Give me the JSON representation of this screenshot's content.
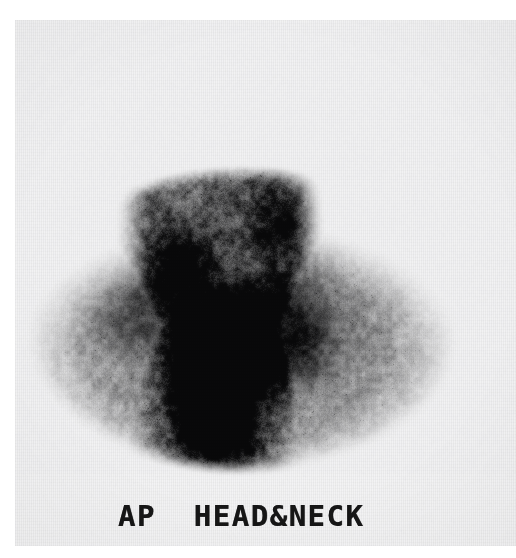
{
  "viewer": {
    "width": 516,
    "height": 558,
    "background_color": "#ffffff"
  },
  "film": {
    "name": "radiographic-film-sheet",
    "background_color": "#f4f4f5",
    "left": 15,
    "top": 20,
    "width": 501,
    "height": 526
  },
  "annotation": {
    "label": "AP  HEAD&NECK",
    "projection": "AP",
    "body_region": "HEAD&NECK",
    "text_color": "#161616"
  },
  "scintigram": {
    "modality": "planar-scintigraphy",
    "colormap": "grayscale-inverted",
    "background_level": "#f2f2f3",
    "max_uptake_color": "#121212",
    "anatomy_outline": "head-and-shoulders silhouette, anterior projection",
    "hot_spots": [
      {
        "name": "right-submandibular-focus",
        "cx": 205,
        "cy": 330,
        "intensity": 1.0
      },
      {
        "name": "left-submandibular-focus",
        "cx": 277,
        "cy": 312,
        "intensity": 0.96
      },
      {
        "name": "central-neck-column",
        "cx": 200,
        "cy": 390,
        "intensity": 0.8
      },
      {
        "name": "left-lateral-focus",
        "cx": 116,
        "cy": 292,
        "intensity": 0.55
      },
      {
        "name": "upper-left-parotid-region",
        "cx": 162,
        "cy": 245,
        "intensity": 0.5
      },
      {
        "name": "upper-right-orbital-focus",
        "cx": 268,
        "cy": 203,
        "intensity": 0.52
      }
    ]
  },
  "chart_data": {
    "type": "heatmap",
    "title": "AP  HEAD&NECK",
    "xlabel": "",
    "ylabel": "",
    "colormap": "gray_r",
    "regions": [
      {
        "label": "cranium",
        "relative_uptake": 0.35
      },
      {
        "label": "right submandibular focus",
        "relative_uptake": 1.0
      },
      {
        "label": "left submandibular focus",
        "relative_uptake": 0.96
      },
      {
        "label": "central neck / thyroid bed column",
        "relative_uptake": 0.8
      },
      {
        "label": "left lateral neck focus",
        "relative_uptake": 0.55
      },
      {
        "label": "shoulders / soft tissue",
        "relative_uptake": 0.18
      },
      {
        "label": "background film",
        "relative_uptake": 0.04
      }
    ],
    "intensity_scale": [
      0,
      1
    ]
  }
}
